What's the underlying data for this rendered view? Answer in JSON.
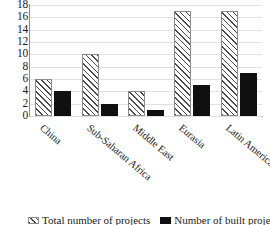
{
  "chart_data": {
    "type": "bar",
    "title": "",
    "xlabel": "",
    "ylabel": "",
    "ylim": [
      0,
      18
    ],
    "yticks": [
      0,
      2,
      4,
      6,
      8,
      10,
      12,
      14,
      16,
      18
    ],
    "grid": true,
    "legend_position": "bottom",
    "categories": [
      "China",
      "Sub-Saharan Africa",
      "Middle East",
      "Eurasia",
      "Latin America"
    ],
    "series": [
      {
        "name": "Total number of projects",
        "style": "hatched",
        "color": "#4a4a4a",
        "values": [
          6,
          10,
          4,
          17,
          17
        ]
      },
      {
        "name": "Number of built projects",
        "style": "solid",
        "color": "#101010",
        "values": [
          4,
          2,
          1,
          5,
          7
        ]
      }
    ]
  },
  "axis": {
    "ytick_labels": [
      "18",
      "16",
      "14",
      "12",
      "10",
      "8",
      "6",
      "4",
      "2",
      "0"
    ]
  },
  "legend": {
    "items": [
      {
        "label": "Total number of projects",
        "swatch": "hatch-swatch"
      },
      {
        "label": "Number of built projects",
        "swatch": "solid-swatch"
      }
    ]
  }
}
